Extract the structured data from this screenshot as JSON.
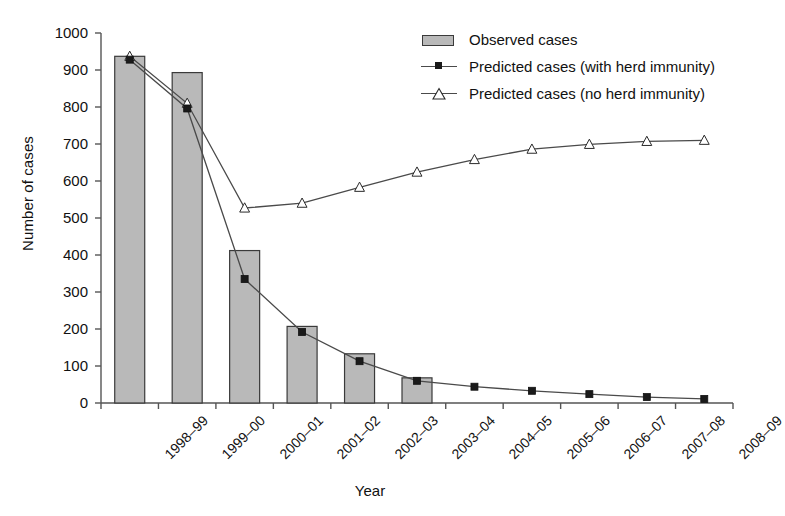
{
  "chart_data": {
    "type": "bar",
    "title": "",
    "xlabel": "Year",
    "ylabel": "Number of cases",
    "ylim": [
      0,
      1000
    ],
    "ytick_step": 100,
    "yticks": [
      0,
      100,
      200,
      300,
      400,
      500,
      600,
      700,
      800,
      900,
      1000
    ],
    "grid": false,
    "legend_position": "top-right",
    "categories": [
      "1998–99",
      "1999–00",
      "2000–01",
      "2001–02",
      "2002–03",
      "2003–04",
      "2004–05",
      "2005–06",
      "2006–07",
      "2007–08",
      "2008–09"
    ],
    "series": [
      {
        "name": "Observed cases",
        "kind": "bar",
        "color": "#b9b9b9",
        "edge_color": "#3a3a3a",
        "values": [
          937,
          893,
          412,
          207,
          133,
          68,
          null,
          null,
          null,
          null,
          null
        ]
      },
      {
        "name": "Predicted cases (with herd immunity)",
        "kind": "line",
        "marker": "square",
        "color": "#4a4a4a",
        "marker_color": "#1a1a1a",
        "values": [
          928,
          796,
          335,
          192,
          113,
          60,
          44,
          33,
          24,
          16,
          11
        ]
      },
      {
        "name": "Predicted cases (no herd immunity)",
        "kind": "line",
        "marker": "triangle",
        "color": "#4a4a4a",
        "marker_color": "#ffffff",
        "values": [
          937,
          810,
          527,
          540,
          583,
          624,
          658,
          686,
          699,
          707,
          710
        ]
      }
    ]
  },
  "axes": {
    "y_title": "Number of cases",
    "x_title": "Year"
  },
  "legend": {
    "items": [
      {
        "label": "Observed cases",
        "key": "bar-swatch"
      },
      {
        "label": "Predicted cases (with herd immunity)",
        "key": "line-square-marker"
      },
      {
        "label": "Predicted cases (no herd immunity)",
        "key": "line-triangle-marker"
      }
    ]
  }
}
